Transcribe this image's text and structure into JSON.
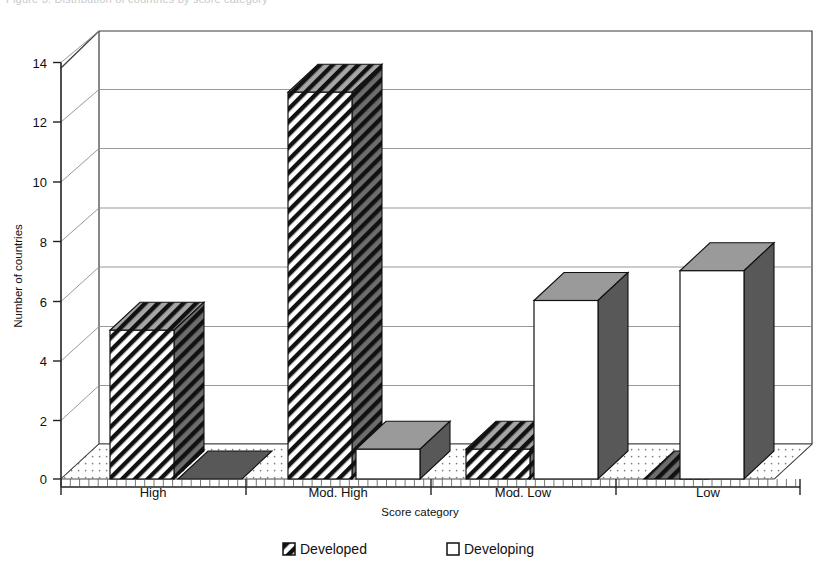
{
  "caption": {
    "clipped_text": "Figure 3. Distribution of countries by score category"
  },
  "chart_data": {
    "type": "bar",
    "title": "",
    "xlabel": "Score category",
    "ylabel": "Number of countries",
    "categories": [
      "High",
      "Mod. High",
      "Mod. Low",
      "Low"
    ],
    "series": [
      {
        "name": "Developed",
        "values": [
          5,
          13,
          1,
          0
        ],
        "pattern": "diagonal-hatch"
      },
      {
        "name": "Developing",
        "values": [
          0,
          1,
          6,
          7
        ],
        "pattern": "solid-white"
      }
    ],
    "ylim": [
      0,
      14
    ],
    "yticks": [
      0,
      2,
      4,
      6,
      8,
      10,
      12,
      14
    ],
    "ytick_labels": [
      "0",
      "2",
      "4",
      "6",
      "8",
      "10",
      "12",
      "14"
    ],
    "grid": true,
    "grid_axis": "y",
    "legend_position": "bottom",
    "style": "3d-isometric-bar",
    "colors": {
      "bar_outline": "#111111",
      "bar_side": "#585858",
      "bar_top": "#9a9a9a",
      "bar_face_developing": "#ffffff",
      "gridline": "#8d8d8d",
      "floor": "#ffffff",
      "background": "#ffffff"
    }
  },
  "axes": {
    "y_title": "Number of countries",
    "x_title": "Score category",
    "y_tick_labels": [
      "0",
      "2",
      "4",
      "6",
      "8",
      "10",
      "12",
      "14"
    ],
    "x_tick_labels": [
      "High",
      "Mod. High",
      "Mod. Low",
      "Low"
    ]
  },
  "legend": {
    "items": [
      {
        "label": "Developed",
        "swatch": "hatched-square"
      },
      {
        "label": "Developing",
        "swatch": "empty-square"
      }
    ]
  }
}
